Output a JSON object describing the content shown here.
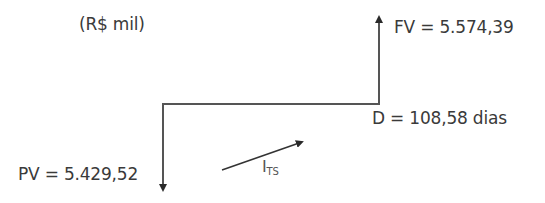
{
  "diagram": {
    "type": "cash-flow-diagram",
    "unit_label": "(R$ mil)",
    "future_value": {
      "label": "FV = 5.574,39",
      "name": "FV",
      "value": "5.574,39",
      "direction": "up"
    },
    "present_value": {
      "label": "PV = 5.429,52",
      "name": "PV",
      "value": "5.429,52",
      "direction": "down"
    },
    "duration": {
      "label": "D = 108,58 dias",
      "name": "D",
      "value": "108,58",
      "unit": "dias"
    },
    "rate": {
      "symbol": "I",
      "subscript": "TS"
    },
    "colors": {
      "line": "#555555",
      "text": "#3a3a3a",
      "background": "#ffffff"
    }
  }
}
